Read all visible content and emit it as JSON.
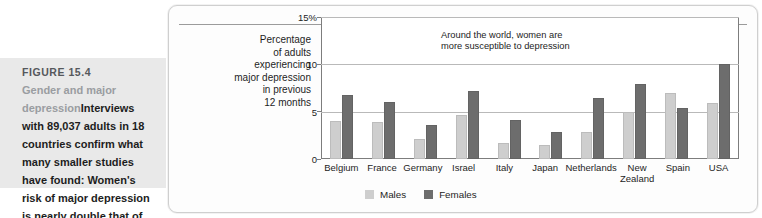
{
  "caption": {
    "figure_number": "FIGURE 15.4",
    "title": "Gender and major depression",
    "body": "Interviews with 89,037 adults in 18 countries confirm what many smaller studies have found: Women's risk of major depression is nearly double that of men's."
  },
  "legend": {
    "males_label": "Males",
    "females_label": "Females",
    "males_color": "#cecece",
    "females_color": "#6d6d6d"
  },
  "annotation": "Around the world, women are more susceptible to depression",
  "axis_title_lines": [
    "Percentage",
    "of adults",
    "experiencing",
    "major depression",
    "in previous",
    "12 months"
  ],
  "chart_data": {
    "type": "bar",
    "title": "",
    "subtitle": "",
    "xlabel": "",
    "ylabel": "Percentage of adults experiencing major depression in previous 12 months",
    "ylim": [
      0,
      15
    ],
    "yticks": [
      0,
      5,
      10,
      15
    ],
    "ytick_labels": [
      "0",
      "5",
      "10",
      "15%"
    ],
    "grid": true,
    "legend_position": "bottom",
    "annotations": [
      "Around the world, women are more susceptible to depression"
    ],
    "categories": [
      "Belgium",
      "France",
      "Germany",
      "Israel",
      "Italy",
      "Japan",
      "Netherlands",
      "New Zealand",
      "Spain",
      "USA"
    ],
    "series": [
      {
        "name": "Males",
        "color": "#cecece",
        "values": [
          4.0,
          3.9,
          2.1,
          4.7,
          1.7,
          1.5,
          2.9,
          5.0,
          7.0,
          5.9
        ]
      },
      {
        "name": "Females",
        "color": "#6d6d6d",
        "values": [
          6.8,
          6.0,
          3.6,
          7.2,
          4.1,
          2.9,
          6.4,
          7.9,
          5.4,
          10.0
        ]
      }
    ]
  }
}
